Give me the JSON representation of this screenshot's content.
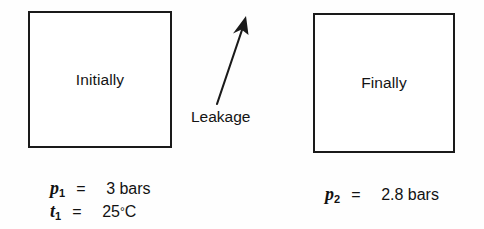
{
  "figure": {
    "background_color": "#fefefe",
    "line_color": "#1a1a1a",
    "text_color": "#141414"
  },
  "vessels": [
    {
      "name": "initial-vessel",
      "label": "Initially"
    },
    {
      "name": "final-vessel",
      "label": "Finally"
    }
  ],
  "annotations": {
    "leakage_label": "Leakage",
    "arrow_icon": "up-right-arrow-icon"
  },
  "states": {
    "initial": {
      "lines": [
        {
          "symbol": "p",
          "subscript": "1",
          "equals": "=",
          "value": "3 bars"
        },
        {
          "symbol": "t",
          "subscript": "1",
          "equals": "=",
          "value": "25",
          "degree": "°",
          "unit": "C"
        }
      ]
    },
    "final": {
      "lines": [
        {
          "symbol": "p",
          "subscript": "2",
          "equals": "=",
          "value": "2.8 bars"
        }
      ]
    }
  }
}
